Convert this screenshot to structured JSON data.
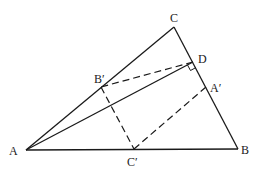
{
  "diagram": {
    "type": "geometry-triangle",
    "points": {
      "A": {
        "x": 26,
        "y": 150
      },
      "B": {
        "x": 238,
        "y": 149
      },
      "C": {
        "x": 174,
        "y": 27
      },
      "D": {
        "x": 193,
        "y": 62
      },
      "B_prime": {
        "x": 101,
        "y": 87
      },
      "A_prime": {
        "x": 206,
        "y": 87
      },
      "C_prime": {
        "x": 134,
        "y": 149
      }
    },
    "labels": {
      "A": "A",
      "B": "B",
      "C": "C",
      "D": "D",
      "B_prime": "B′",
      "A_prime": "A′",
      "C_prime": "C′"
    },
    "solid_segments": [
      [
        "A",
        "B"
      ],
      [
        "B",
        "C"
      ],
      [
        "C",
        "A"
      ],
      [
        "A",
        "D"
      ]
    ],
    "dashed_segments": [
      [
        "D",
        "B_prime"
      ],
      [
        "B_prime",
        "C_prime"
      ],
      [
        "C_prime",
        "A_prime"
      ]
    ],
    "right_angle_at": "D",
    "colors": {
      "stroke": "#1a1a1a",
      "background": "#ffffff"
    }
  }
}
